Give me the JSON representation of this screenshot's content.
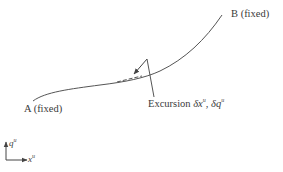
{
  "diagram": {
    "labels": {
      "point_a": "A (fixed)",
      "point_b": "B (fixed)",
      "excursion_prefix": "Excursion ",
      "excursion_dx": "δx",
      "excursion_sep": ", ",
      "excursion_dq": "δq",
      "excursion_sup": "u"
    },
    "axes": {
      "y_label": "q",
      "y_sup": "u",
      "x_label": "x",
      "x_sup": "u"
    },
    "colors": {
      "stroke": "#555555",
      "text": "#3a3a3a"
    }
  }
}
